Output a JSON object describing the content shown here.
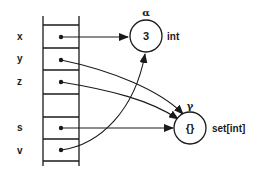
{
  "diagram": {
    "variables": [
      {
        "name": "x",
        "target": "alpha"
      },
      {
        "name": "y",
        "target": "gamma"
      },
      {
        "name": "z",
        "target": "gamma"
      },
      {
        "name": "",
        "target": null
      },
      {
        "name": "s",
        "target": "gamma"
      },
      {
        "name": "v",
        "target": "alpha"
      }
    ],
    "nodes": {
      "alpha": {
        "label": "α",
        "value": "3",
        "type": "int"
      },
      "gamma": {
        "label": "γ",
        "value": "{}",
        "type": "set[int]"
      }
    },
    "colors": {
      "ink": "#1a1a1a",
      "background": "#ffffff"
    }
  }
}
